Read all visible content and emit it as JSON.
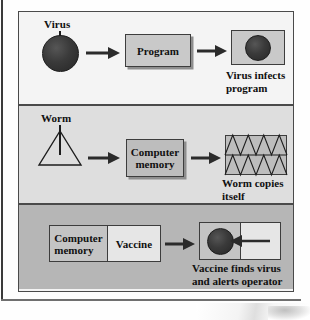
{
  "figure": {
    "title_visible": false,
    "panels": [
      {
        "id": "virus",
        "background_color": "#f4f4f4",
        "source_label": "Virus",
        "source_shape": "filled-circle",
        "target_box_label": "Program",
        "result_box_label": "",
        "result_shape": "filled-circle-in-box",
        "caption": "Virus infects\nprogram",
        "arrows": 2
      },
      {
        "id": "worm",
        "background_color": "#dedede",
        "source_label": "Worm",
        "source_shape": "outline-triangle",
        "target_box_label": "Computer\nmemory",
        "result_box_label": "",
        "result_shape": "triangle-zigzag-grid",
        "caption": "Worm copies\nitself",
        "arrows": 2,
        "zigzag_rows": 2,
        "zigzag_triangles_per_row": 4
      },
      {
        "id": "vaccine",
        "background_color": "#b6b6b6",
        "split_box_left_label": "Computer\nmemory",
        "split_box_right_label": "Vaccine",
        "result_shape": "virus-circle-with-incoming-arrow",
        "caption": "Vaccine finds virus\nand alerts operator",
        "arrows": 2
      }
    ]
  },
  "colors": {
    "panel_1_bg": "#f4f4f4",
    "panel_2_bg": "#dedede",
    "panel_3_bg": "#b6b6b6",
    "box_fill_mid": "#c9c9c9",
    "box_fill_light": "#e9e9e9",
    "virus_fill": "#2e2e2e",
    "stroke": "#3d3d3d",
    "text": "#101010"
  }
}
